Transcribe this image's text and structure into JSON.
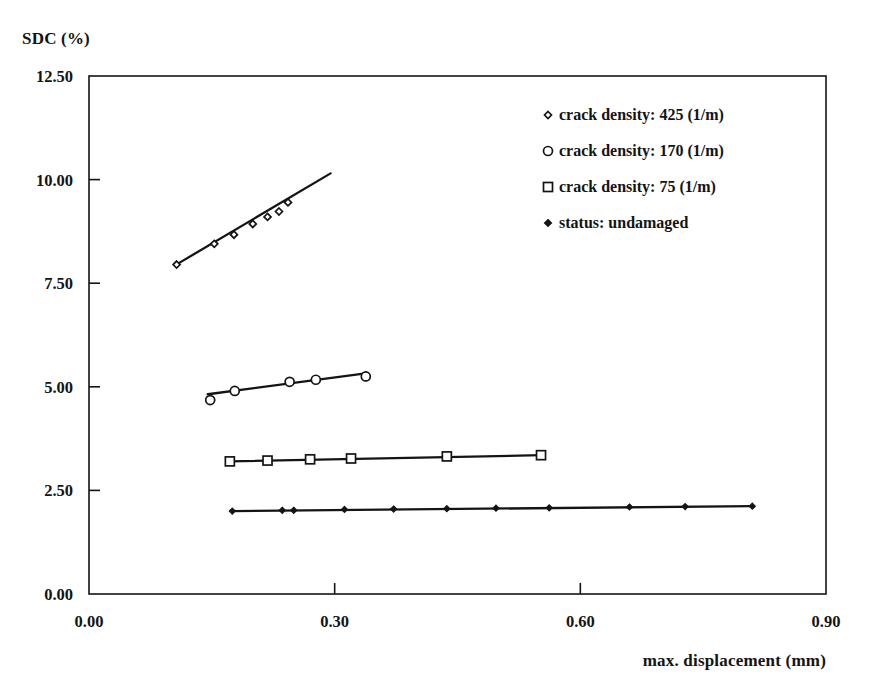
{
  "chart_data": {
    "type": "scatter",
    "title": "",
    "subtitle": "",
    "xlabel": "max. displacement (mm)",
    "ylabel": "SDC (%)",
    "xlim": [
      0.0,
      0.9
    ],
    "ylim": [
      0.0,
      12.5
    ],
    "xticks": [
      "0.00",
      "0.30",
      "0.60",
      "0.90"
    ],
    "xtick_values": [
      0.0,
      0.3,
      0.6,
      0.9
    ],
    "yticks": [
      "0.00",
      "2.50",
      "5.00",
      "7.50",
      "10.00",
      "12.50"
    ],
    "ytick_values": [
      0.0,
      2.5,
      5.0,
      7.5,
      10.0,
      12.5
    ],
    "grid": false,
    "legend_position": "top-right",
    "frame": "box",
    "series": [
      {
        "name": "crack density: 425 (1/m)",
        "marker": "diamond-open",
        "marker_size": 7,
        "trendline": true,
        "trendline_x": [
          0.105,
          0.295
        ],
        "trendline_y": [
          7.93,
          10.15
        ],
        "x": [
          0.107,
          0.153,
          0.177,
          0.2,
          0.218,
          0.232,
          0.243
        ],
        "y": [
          7.95,
          8.45,
          8.67,
          8.93,
          9.1,
          9.23,
          9.45
        ]
      },
      {
        "name": "crack density: 170 (1/m)",
        "marker": "circle-open",
        "marker_size": 9,
        "trendline": true,
        "trendline_x": [
          0.145,
          0.34
        ],
        "trendline_y": [
          4.82,
          5.33
        ],
        "x": [
          0.148,
          0.178,
          0.245,
          0.277,
          0.338
        ],
        "y": [
          4.68,
          4.9,
          5.12,
          5.17,
          5.25
        ]
      },
      {
        "name": "crack density: 75 (1/m)",
        "marker": "square-open",
        "marker_size": 9,
        "trendline": true,
        "trendline_x": [
          0.172,
          0.552
        ],
        "trendline_y": [
          3.2,
          3.35
        ],
        "x": [
          0.172,
          0.218,
          0.27,
          0.32,
          0.437,
          0.552
        ],
        "y": [
          3.2,
          3.22,
          3.25,
          3.27,
          3.32,
          3.35
        ]
      },
      {
        "name": "status: undamaged",
        "marker": "diamond-filled",
        "marker_size": 6,
        "trendline": true,
        "trendline_x": [
          0.175,
          0.81
        ],
        "trendline_y": [
          2.0,
          2.12
        ],
        "x": [
          0.175,
          0.236,
          0.25,
          0.312,
          0.372,
          0.437,
          0.497,
          0.562,
          0.66,
          0.728,
          0.81
        ],
        "y": [
          2.0,
          2.02,
          2.02,
          2.04,
          2.05,
          2.06,
          2.07,
          2.08,
          2.1,
          2.11,
          2.12
        ]
      }
    ]
  },
  "legend": {
    "items": [
      {
        "label": "crack density: 425 (1/m)",
        "marker": "diamond-open"
      },
      {
        "label": "crack density: 170 (1/m)",
        "marker": "circle-open"
      },
      {
        "label": "crack density: 75 (1/m)",
        "marker": "square-open"
      },
      {
        "label": "status: undamaged",
        "marker": "diamond-filled"
      }
    ]
  },
  "style": {
    "axis_color": "#141414",
    "line_color": "#141414",
    "background": "#ffffff"
  }
}
